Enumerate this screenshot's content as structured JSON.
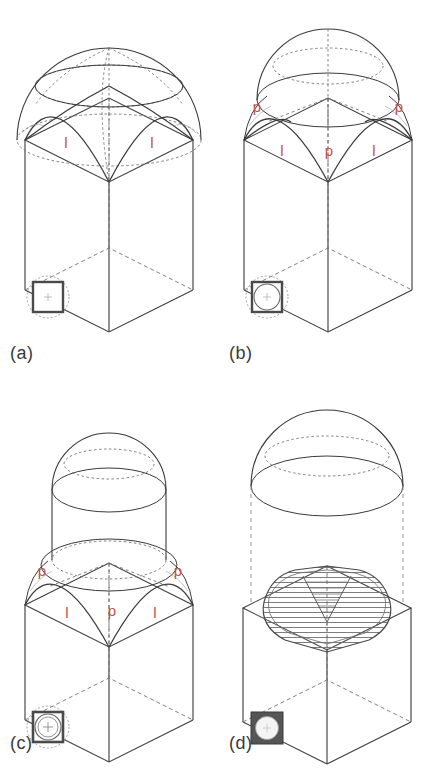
{
  "figure": {
    "background_color": "#ffffff",
    "line_color": "#3a3a3a",
    "hidden_line_color": "#707070",
    "label_color": "#c0504d",
    "caption_color": "#3a3a3a"
  },
  "panels": [
    {
      "id": "a",
      "caption": "(a)",
      "description": "Hemispherical dome circumscribing the square bay, cut by four vertical wall planes forming pendentives",
      "labels": [
        {
          "text": "l",
          "role": "span-of-arch"
        },
        {
          "text": "l",
          "role": "span-of-arch"
        }
      ],
      "inset": {
        "name": "plan-inset-a",
        "description": "square plan with dashed circumscribed circle",
        "square_fill": "#ffffff",
        "circle_style": "dashed-circumscribed"
      }
    },
    {
      "id": "b",
      "caption": "(b)",
      "description": "Dome sliced by a horizontal plane at the crown of the arches, leaving pendentives and a smaller hemispherical cap",
      "labels": [
        {
          "text": "p",
          "role": "pendentive"
        },
        {
          "text": "p",
          "role": "pendentive"
        },
        {
          "text": "l",
          "role": "span-of-arch"
        },
        {
          "text": "p",
          "role": "pendentive"
        },
        {
          "text": "l",
          "role": "span-of-arch"
        }
      ],
      "inset": {
        "name": "plan-inset-b",
        "description": "square plan with inscribed circle and dashed circumscribed circle",
        "square_fill": "#ffffff",
        "circle_style": "inscribed-plus-circumscribed"
      }
    },
    {
      "id": "c",
      "caption": "(c)",
      "description": "Cylindrical drum raised on the horizontal cut, carrying a separate hemispherical dome above the pendentives",
      "labels": [
        {
          "text": "p",
          "role": "pendentive"
        },
        {
          "text": "p",
          "role": "pendentive"
        },
        {
          "text": "l",
          "role": "span-of-arch"
        },
        {
          "text": "p",
          "role": "pendentive"
        },
        {
          "text": "l",
          "role": "span-of-arch"
        }
      ],
      "inset": {
        "name": "plan-inset-c",
        "description": "square plan with inscribed circle, drum ring and dashed circumscribed circle",
        "square_fill": "#ffffff",
        "circle_style": "drum-ring"
      }
    },
    {
      "id": "d",
      "caption": "(d)",
      "description": "Exploded view: the dome lifted clear on dashed projection lines above the hatched pendentive zone on the cube",
      "labels": [],
      "hatching": {
        "name": "pendentive-hatch",
        "style": "horizontal-lines",
        "color": "#6e6e6e"
      },
      "inset": {
        "name": "plan-inset-d",
        "description": "dark filled square plan with light circular opening",
        "square_fill": "#555555",
        "circle_style": "solid-light-circle"
      }
    }
  ]
}
